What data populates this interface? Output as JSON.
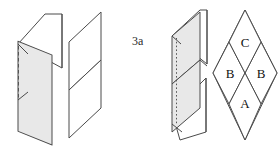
{
  "figure": {
    "caption_fragment": "",
    "panel_label": "3a",
    "background_color": "#ffffff",
    "shaded_fill": "#e8e8e8",
    "unshaded_fill": "#ffffff",
    "stroke_color": "#4a4a4a",
    "labels": {
      "region_top": "C",
      "region_left": "B",
      "region_right": "B",
      "region_bottom": "A"
    },
    "panels": [
      {
        "name": "left-pair",
        "description": "shaded parallelogram with white parallelogram behind, dashed vertical edge"
      },
      {
        "name": "center-pair",
        "description": "two stacked white parallelograms"
      },
      {
        "name": "right-pair",
        "description": "two stacked shaded parallelograms with dotted vertical edge and white parallelograms crossing behind"
      },
      {
        "name": "diamond-lattice",
        "description": "four-region rhombus lattice labelled C, B, B, A"
      }
    ]
  }
}
